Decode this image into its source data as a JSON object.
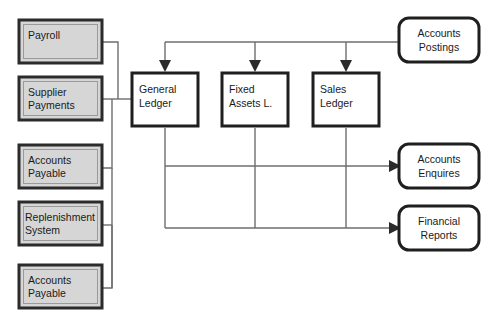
{
  "diagram": {
    "canvas": {
      "width": 498,
      "height": 326
    },
    "colors": {
      "source_fill": "#d6d6d6",
      "source_border": "#2b2b2b",
      "ledger_fill": "#ffffff",
      "ledger_border": "#1f1f1f",
      "output_fill": "#ffffff",
      "output_border": "#1f1f1f",
      "connector": "#6e6e6e",
      "arrow": "#2b2b2b",
      "background": "#ffffff",
      "text": "#1a1a1a"
    },
    "source_nodes": [
      {
        "id": "payroll",
        "label_line1": "Payroll",
        "label_line2": ""
      },
      {
        "id": "supplier-payments",
        "label_line1": "Supplier",
        "label_line2": "Payments"
      },
      {
        "id": "accounts-payable-1",
        "label_line1": "Accounts",
        "label_line2": "Payable"
      },
      {
        "id": "replenishment-system",
        "label_line1": "Replenishment",
        "label_line2": "System"
      },
      {
        "id": "accounts-payable-2",
        "label_line1": "Accounts",
        "label_line2": "Payable"
      }
    ],
    "ledger_nodes": [
      {
        "id": "general-ledger",
        "label_line1": "General",
        "label_line2": "Ledger"
      },
      {
        "id": "fixed-assets-ledger",
        "label_line1": "Fixed",
        "label_line2": "Assets L."
      },
      {
        "id": "sales-ledger",
        "label_line1": "Sales",
        "label_line2": "Ledger"
      }
    ],
    "output_nodes": [
      {
        "id": "accounts-postings",
        "label_line1": "Accounts",
        "label_line2": "Postings"
      },
      {
        "id": "accounts-enquires",
        "label_line1": "Accounts",
        "label_line2": "Enquires"
      },
      {
        "id": "financial-reports",
        "label_line1": "Financial",
        "label_line2": "Reports"
      }
    ]
  }
}
